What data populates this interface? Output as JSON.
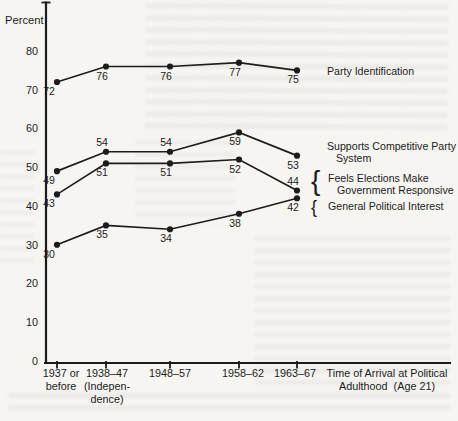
{
  "page": {
    "background": "#f6f5f2",
    "ink": "#1c1c1c"
  },
  "chart_data": {
    "type": "line",
    "title": "",
    "ylabel": "Percent",
    "xlabel": "Time of Arrival at Political Adulthood (Age 21)",
    "xlabel_lines": [
      "Time of Arrival at Political",
      "Adulthood  (Age 21)"
    ],
    "ylim": [
      0,
      85
    ],
    "yticks": [
      80,
      70,
      60,
      50,
      40,
      30,
      20,
      10,
      0
    ],
    "grid": false,
    "legend_position": "right-annotations",
    "categories": [
      "1937 or before",
      "1938–47 (Independence)",
      "1948–57",
      "1958–62",
      "1963–67"
    ],
    "category_label_lines": [
      [
        "1937 or",
        "before"
      ],
      [
        "1938–47",
        "(Indepen-",
        "dence)"
      ],
      [
        "1948–57"
      ],
      [
        "1958–62"
      ],
      [
        "1963–67"
      ]
    ],
    "series": [
      {
        "name": "Party Identification",
        "label_lines": [
          "Party Identification"
        ],
        "bracket": false,
        "values": [
          72,
          76,
          76,
          77,
          75
        ],
        "label_above": [
          false,
          false,
          false,
          false,
          false
        ]
      },
      {
        "name": "Supports Competitive Party System",
        "label_lines": [
          "Supports Competitive Party",
          "System"
        ],
        "bracket": false,
        "values": [
          49,
          54,
          54,
          59,
          53
        ],
        "label_above": [
          false,
          true,
          true,
          false,
          false
        ]
      },
      {
        "name": "Feels Elections Make Government Responsive",
        "label_lines": [
          "Feels Elections Make",
          "Government Responsive"
        ],
        "bracket": true,
        "values": [
          43,
          51,
          51,
          52,
          44
        ],
        "label_above": [
          false,
          false,
          false,
          false,
          true
        ]
      },
      {
        "name": "General Political Interest",
        "label_lines": [
          "General Political Interest"
        ],
        "bracket": true,
        "values": [
          30,
          35,
          34,
          38,
          42
        ],
        "label_above": [
          false,
          false,
          false,
          false,
          false
        ]
      }
    ],
    "line_color": "#1c1c1c"
  }
}
